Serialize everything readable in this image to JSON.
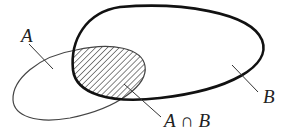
{
  "diagram": {
    "type": "venn",
    "sets": [
      {
        "id": "A",
        "label": "A",
        "stroke": "#444444",
        "stroke_width": 1.2
      },
      {
        "id": "B",
        "label": "B",
        "stroke": "#111111",
        "stroke_width": 2.6
      }
    ],
    "intersection": {
      "label": "A ∩ B",
      "fill": "hatched",
      "hatch_color": "#222222"
    }
  },
  "labels": {
    "a": "A",
    "b": "B",
    "a_cap_b": "A ∩ B"
  }
}
